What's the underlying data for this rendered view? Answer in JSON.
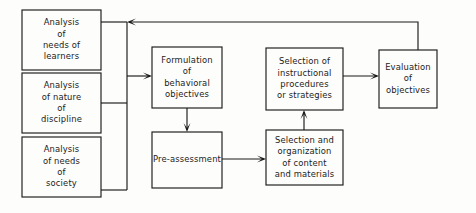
{
  "diagram": {
    "colors": {
      "background": "#fdfdfb",
      "stroke": "#1a1a1a",
      "box_fill": "#fdfdfb",
      "text": "#1b1b1b"
    },
    "canvas": {
      "width": 476,
      "height": 213
    },
    "nodes": [
      {
        "id": "analysis-needs-learners",
        "name": "box-analysis-of-needs-of-learners",
        "x": 22,
        "y": 10,
        "w": 79,
        "h": 60,
        "lines": [
          "Analysis",
          "of",
          "needs of",
          "learners"
        ]
      },
      {
        "id": "analysis-nature-discipline",
        "name": "box-analysis-of-nature-of-discipline",
        "x": 22,
        "y": 73,
        "w": 79,
        "h": 60,
        "lines": [
          "Analysis",
          "of nature",
          "of",
          "discipline"
        ]
      },
      {
        "id": "analysis-needs-society",
        "name": "box-analysis-of-needs-of-society",
        "x": 22,
        "y": 137,
        "w": 79,
        "h": 60,
        "lines": [
          "Analysis",
          "of needs",
          "of",
          "society"
        ]
      },
      {
        "id": "formulation-objectives",
        "name": "box-formulation-of-behavioral-objectives",
        "x": 152,
        "y": 47,
        "w": 70,
        "h": 61,
        "lines": [
          "Formulation",
          "of",
          "behavioral",
          "objectives"
        ]
      },
      {
        "id": "pre-assessment",
        "name": "box-pre-assessment",
        "x": 152,
        "y": 132,
        "w": 70,
        "h": 56,
        "lines": [
          "Pre-assessment"
        ]
      },
      {
        "id": "selection-instructional-procedures",
        "name": "box-selection-of-instructional-procedures-or-strategies",
        "x": 266,
        "y": 48,
        "w": 77,
        "h": 62,
        "lines": [
          "Selection of",
          "instructional",
          "procedures",
          "or  strategies"
        ]
      },
      {
        "id": "selection-organization-content",
        "name": "box-selection-and-organization-of-content-and-materials",
        "x": 266,
        "y": 130,
        "w": 77,
        "h": 55,
        "lines": [
          "Selection and",
          "organization",
          "of content",
          "and materials"
        ]
      },
      {
        "id": "evaluation-objectives",
        "name": "box-evaluation-of-objectives",
        "x": 379,
        "y": 50,
        "w": 58,
        "h": 58,
        "lines": [
          "Evaluation",
          "of",
          "objectives"
        ]
      }
    ],
    "connectors": [
      {
        "id": "learners-to-bus",
        "name": "connector-learners-to-input-bus",
        "path": "M 101 22 L 127 22",
        "arrow": null
      },
      {
        "id": "discipline-to-bus",
        "name": "connector-discipline-to-input-bus",
        "path": "M 101 103 L 127 103",
        "arrow": null
      },
      {
        "id": "society-to-bus",
        "name": "connector-society-to-input-bus",
        "path": "M 101 190 L 127 190",
        "arrow": null
      },
      {
        "id": "input-bus",
        "name": "connector-input-bus-vertical",
        "path": "M 127 22 L 127 190",
        "arrow": null
      },
      {
        "id": "bus-to-formulation",
        "name": "connector-inputs-to-formulation",
        "path": "M 127 76 L 150 76",
        "arrow": {
          "x": 152,
          "y": 76,
          "dir": "right"
        }
      },
      {
        "id": "formulation-to-preassessment",
        "name": "connector-formulation-to-pre-assessment",
        "path": "M 187 108 L 187 130",
        "arrow": {
          "x": 187,
          "y": 132,
          "dir": "down"
        }
      },
      {
        "id": "preassessment-to-content",
        "name": "connector-pre-assessment-to-selection-and-organization",
        "path": "M 222 159 L 264 159",
        "arrow": {
          "x": 266,
          "y": 159,
          "dir": "right"
        }
      },
      {
        "id": "content-to-procedures",
        "name": "connector-selection-and-organization-to-instructional-procedures",
        "path": "M 304 130 L 304 112",
        "arrow": {
          "x": 304,
          "y": 110,
          "dir": "up"
        }
      },
      {
        "id": "procedures-to-evaluation",
        "name": "connector-instructional-procedures-to-evaluation",
        "path": "M 343 76 L 377 76",
        "arrow": {
          "x": 379,
          "y": 76,
          "dir": "right"
        }
      },
      {
        "id": "evaluation-feedback",
        "name": "connector-evaluation-feedback-loop",
        "path": "M 418 50 L 418 22 L 129 22",
        "arrow": {
          "x": 127,
          "y": 22,
          "dir": "left"
        }
      }
    ]
  }
}
